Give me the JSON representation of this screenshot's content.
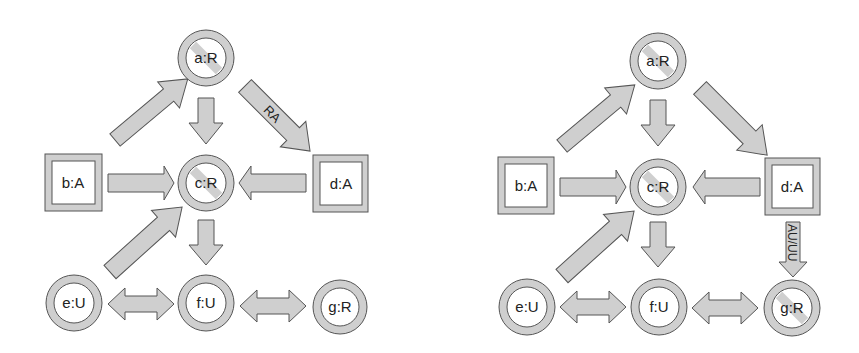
{
  "colors": {
    "fill": "#cfcfcf",
    "stroke": "#555555",
    "inner": "#ffffff",
    "text": "#222222"
  },
  "diagrams": [
    {
      "name": "left",
      "nodes": {
        "a": {
          "label": "a:R",
          "shape": "circle-prohibited"
        },
        "b": {
          "label": "b:A",
          "shape": "square"
        },
        "c": {
          "label": "c:R",
          "shape": "circle-prohibited"
        },
        "d": {
          "label": "d:A",
          "shape": "square"
        },
        "e": {
          "label": "e:U",
          "shape": "circle"
        },
        "f": {
          "label": "f:U",
          "shape": "circle"
        },
        "g": {
          "label": "g:R",
          "shape": "circle"
        }
      },
      "edges": [
        {
          "from": "b",
          "to": "a",
          "label": ""
        },
        {
          "from": "a",
          "to": "c",
          "label": ""
        },
        {
          "from": "a",
          "to": "d",
          "label": "RA"
        },
        {
          "from": "b",
          "to": "c",
          "label": ""
        },
        {
          "from": "d",
          "to": "c",
          "label": ""
        },
        {
          "from": "e",
          "to": "c",
          "label": ""
        },
        {
          "from": "c",
          "to": "f",
          "label": ""
        },
        {
          "from": "e",
          "to": "f",
          "label": "",
          "bidirectional": true
        },
        {
          "from": "f",
          "to": "g",
          "label": "",
          "bidirectional": true
        }
      ]
    },
    {
      "name": "right",
      "nodes": {
        "a": {
          "label": "a:R",
          "shape": "circle-prohibited"
        },
        "b": {
          "label": "b:A",
          "shape": "square"
        },
        "c": {
          "label": "c:R",
          "shape": "circle-prohibited"
        },
        "d": {
          "label": "d:A",
          "shape": "square"
        },
        "e": {
          "label": "e:U",
          "shape": "circle"
        },
        "f": {
          "label": "f:U",
          "shape": "circle"
        },
        "g": {
          "label": "g:R",
          "shape": "circle-prohibited"
        }
      },
      "edges": [
        {
          "from": "b",
          "to": "a",
          "label": ""
        },
        {
          "from": "a",
          "to": "c",
          "label": ""
        },
        {
          "from": "a",
          "to": "d",
          "label": ""
        },
        {
          "from": "b",
          "to": "c",
          "label": ""
        },
        {
          "from": "d",
          "to": "c",
          "label": ""
        },
        {
          "from": "d",
          "to": "g",
          "label": "AU/UU"
        },
        {
          "from": "e",
          "to": "c",
          "label": ""
        },
        {
          "from": "c",
          "to": "f",
          "label": ""
        },
        {
          "from": "e",
          "to": "f",
          "label": "",
          "bidirectional": true
        },
        {
          "from": "f",
          "to": "g",
          "label": "",
          "bidirectional": true
        }
      ]
    }
  ]
}
